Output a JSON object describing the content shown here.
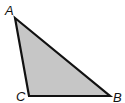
{
  "diagram": {
    "type": "triangle",
    "fill_color": "#c6c6c6",
    "stroke_color": "#111111",
    "vertices": [
      {
        "label": "A",
        "x": 15,
        "y": 18,
        "label_x": 5,
        "label_y": 15
      },
      {
        "label": "C",
        "x": 29,
        "y": 96,
        "label_x": 16,
        "label_y": 101
      },
      {
        "label": "B",
        "x": 110,
        "y": 96,
        "label_x": 113,
        "label_y": 102
      }
    ]
  }
}
